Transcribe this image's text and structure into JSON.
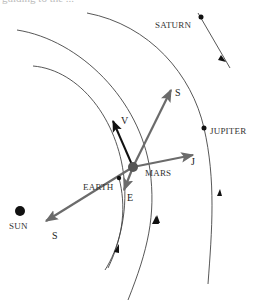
{
  "header": {
    "clipped_caption": "guiding to the ..."
  },
  "colors": {
    "orbit": "#444444",
    "vector_gray": "#6b6b6b",
    "vector_black": "#111111",
    "planet": "#111111",
    "mars": "#555555",
    "label": "#333333"
  },
  "bodies": {
    "sun": {
      "label": "SUN"
    },
    "earth": {
      "label": "EARTH"
    },
    "mars": {
      "label": "MARS"
    },
    "jupiter": {
      "label": "JUPITER"
    },
    "saturn": {
      "label": "SATURN"
    }
  },
  "vectors": {
    "s_outer": {
      "label": "S"
    },
    "s_sun": {
      "label": "S"
    },
    "jupiter": {
      "label": "J"
    },
    "velocity": {
      "label": "V"
    },
    "earth": {
      "label": "E"
    }
  }
}
